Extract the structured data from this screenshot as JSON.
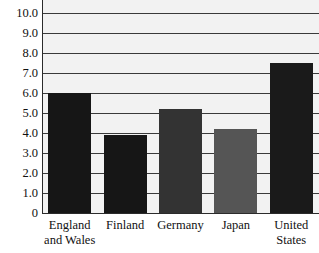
{
  "chart_data": {
    "type": "bar",
    "title": "",
    "subtitle": "",
    "xlabel": "",
    "ylabel": "",
    "categories": [
      "England and Wales",
      "Finland",
      "Germany",
      "Japan",
      "United States"
    ],
    "category_lines": [
      [
        "England",
        "and Wales"
      ],
      [
        "Finland"
      ],
      [
        "Germany"
      ],
      [
        "Japan"
      ],
      [
        "United",
        "States"
      ]
    ],
    "values": [
      6.0,
      3.9,
      5.2,
      4.2,
      7.5
    ],
    "bar_colors": [
      "#161616",
      "#161616",
      "#333333",
      "#555555",
      "#1a1a1a"
    ],
    "ylim": [
      0,
      10.0
    ],
    "y_ticks": [
      0,
      1.0,
      2.0,
      3.0,
      4.0,
      5.0,
      6.0,
      7.0,
      8.0,
      9.0,
      10.0
    ],
    "y_tick_labels": [
      "0",
      "1.0",
      "2.0",
      "3.0",
      "4.0",
      "5.0",
      "6.0",
      "7.0",
      "8.0",
      "9.0",
      "10.0"
    ],
    "grid": true,
    "grid_axis": "y",
    "legend": null,
    "legend_position": "none",
    "plot_background": "#f2f2f2",
    "gridline_color": "#3a3a3a",
    "axis_color": "#2b2b2b",
    "text_color": "#111111"
  }
}
